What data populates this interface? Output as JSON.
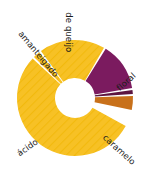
{
  "chart_data": {
    "type": "pie",
    "variant": "donut",
    "title": "",
    "subtitle": "",
    "xlabel": "",
    "ylabel": "",
    "legend_position": "labels-around-arcs",
    "grid": false,
    "categories": [
      "ácido",
      "amanteigado",
      "de queijo",
      "floral",
      "outro",
      "caramelo"
    ],
    "values": [
      56,
      2,
      20,
      14,
      1,
      4
    ],
    "labels": [
      "ácido",
      "amanteigado",
      "de queijo",
      "floral",
      "",
      "caramelo"
    ],
    "colors": [
      "#F7C125",
      "#F7C125",
      "#F7C125",
      "#7B1B5F",
      "#5C1540",
      "#C8711B"
    ],
    "annotations": []
  },
  "chart": {
    "segments": [
      {
        "id": "acido",
        "name": "ácido",
        "label": "ácido",
        "color": "#F7C125",
        "start_angle": 119,
        "end_angle": 313,
        "hatched": true,
        "label_x": 18,
        "label_y": 150,
        "label_rotation": -35
      },
      {
        "id": "amanteigado",
        "name": "amanteigado",
        "label": "amanteigado",
        "color": "#F7C125",
        "start_angle": 315,
        "end_angle": 322,
        "hatched": true,
        "label_x": 20,
        "label_y": 28,
        "label_rotation": 50
      },
      {
        "id": "de-queijo",
        "name": "de queijo",
        "label": "de queijo",
        "color": "#F7C125",
        "start_angle": 324,
        "end_angle": 390,
        "hatched": true,
        "label_x": 69,
        "label_y": 8,
        "label_rotation": 90
      },
      {
        "id": "floral",
        "name": "floral",
        "label": "floral",
        "color": "#7B1B5F",
        "start_angle": 392,
        "end_angle": 440,
        "hatched": false,
        "label_x": 118,
        "label_y": 85,
        "label_rotation": -42
      },
      {
        "id": "outro",
        "name": "outro",
        "label": "",
        "color": "#5C1540",
        "start_angle": 442,
        "end_angle": 446,
        "hatched": false,
        "label_x": 0,
        "label_y": 0,
        "label_rotation": 0
      },
      {
        "id": "caramelo",
        "name": "caramelo",
        "label": "caramelo",
        "color": "#C8711B",
        "start_angle": 448,
        "end_angle": 462,
        "hatched": false,
        "label_x": 104,
        "label_y": 132,
        "label_rotation": 42
      }
    ],
    "geometry": {
      "center_x": 75,
      "center_y": 98,
      "outer_radius": 58,
      "inner_radius": 20
    },
    "background_color": "#FFFFFF",
    "label_color": "#1B1B1B"
  }
}
